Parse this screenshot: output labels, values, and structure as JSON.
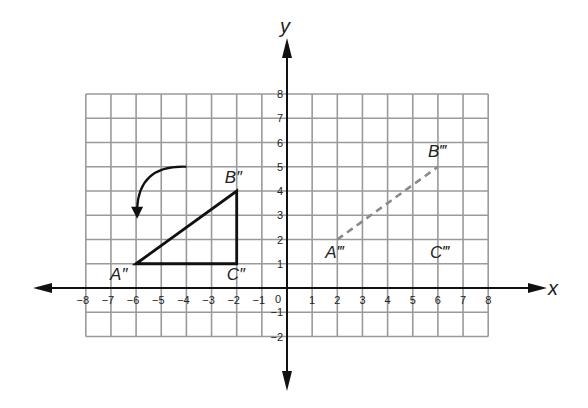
{
  "diagram": {
    "type": "coordinate-plane-transformation",
    "axes": {
      "x_label": "x",
      "y_label": "y",
      "origin_label": "0",
      "x_ticks": [
        "-8",
        "-7",
        "-6",
        "-5",
        "-4",
        "-3",
        "-2",
        "-1",
        "1",
        "2",
        "3",
        "4",
        "5",
        "6",
        "7",
        "8"
      ],
      "y_ticks": [
        "8",
        "7",
        "6",
        "5",
        "4",
        "3",
        "2",
        "1",
        "-1",
        "-2"
      ],
      "x_range": [
        -8,
        8
      ],
      "y_range": [
        -2,
        8
      ]
    },
    "grid": {
      "color": "#9a9a9a",
      "shown": true
    },
    "triangle_double_prime": {
      "style": "solid",
      "color": "#111111",
      "vertices": [
        {
          "label": "A″",
          "x": -6,
          "y": 1
        },
        {
          "label": "B″",
          "x": -2,
          "y": 4
        },
        {
          "label": "C″",
          "x": -2,
          "y": 1
        }
      ]
    },
    "triangle_triple_prime": {
      "style": "dashed",
      "color": "#8a8a8a",
      "vertices": [
        {
          "label": "A‴",
          "x": 2,
          "y": 2
        },
        {
          "label": "B‴",
          "x": 6,
          "y": 5
        },
        {
          "label": "C‴",
          "x": 6,
          "y": 2
        }
      ]
    },
    "rotation_arrow": {
      "from": [
        -4,
        5
      ],
      "to": [
        -6,
        3.1
      ],
      "direction": "counterclockwise"
    }
  }
}
